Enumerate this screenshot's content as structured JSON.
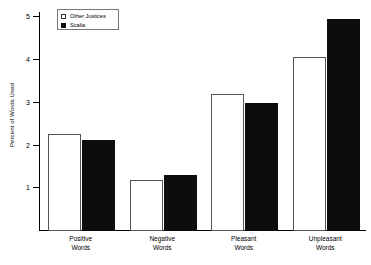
{
  "chart_data": {
    "type": "bar",
    "title": "",
    "xlabel": "",
    "ylabel": "Percent of Words Used",
    "categories": [
      "Positive Words",
      "Negative Words",
      "Pleasant Words",
      "Unpleasant Words"
    ],
    "category_lines": [
      [
        "Positive",
        "Words"
      ],
      [
        "Negative",
        "Words"
      ],
      [
        "Pleasant",
        "Words"
      ],
      [
        "Unpleasant",
        "Words"
      ]
    ],
    "series": [
      {
        "name": "Other Justices",
        "values": [
          2.28,
          1.2,
          3.2,
          4.07
        ],
        "color": "#ffffff",
        "edge": "#555555"
      },
      {
        "name": "Scalia",
        "values": [
          2.12,
          1.31,
          3.0,
          4.95
        ],
        "color": "#0d0d0d",
        "edge": "#0d0d0d"
      }
    ],
    "ylim": [
      0,
      5.1
    ],
    "yticks": [
      1,
      2,
      3,
      4,
      5
    ],
    "ytick_labels": [
      "1",
      "2",
      "3",
      "4",
      "5"
    ],
    "grid": false,
    "legend_position": "top-left",
    "legend": [
      {
        "label": "Other Justices",
        "swatch": "light"
      },
      {
        "label": "Scalia",
        "swatch": "dark"
      }
    ]
  }
}
